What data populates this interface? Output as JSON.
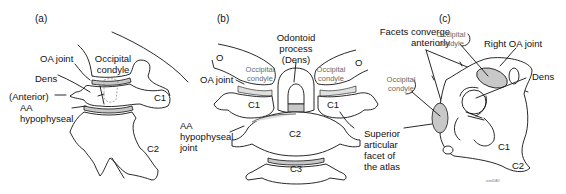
{
  "figure": {
    "panels": [
      {
        "id": "a",
        "tag": "(a)",
        "labels": {
          "oa_joint": "OA joint",
          "occipital_condyle_1": "Occipital",
          "occipital_condyle_2": "condyle",
          "dens": "Dens",
          "anterior": "(Anterior)",
          "aa_1": "AA",
          "aa_2": "hypophyseal",
          "c1": "C1",
          "c2": "C2"
        }
      },
      {
        "id": "b",
        "tag": "(b)",
        "labels": {
          "odontoid_1": "Odontoid",
          "odontoid_2": "process",
          "odontoid_3": "(Dens)",
          "o_left": "O",
          "o_right": "O",
          "oa_joint": "OA joint",
          "occ_left_1": "Occipital",
          "occ_left_2": "condyle",
          "occ_right_1": "Occipital",
          "occ_right_2": "condyle",
          "c1_left": "C1",
          "c1_right": "C1",
          "c2": "C2",
          "c3": "C3",
          "aa_1": "AA",
          "aa_2": "hypophyseal",
          "aa_3": "joint",
          "sup_1": "Superior",
          "sup_2": "articular",
          "sup_3": "facet of",
          "sup_4": "the atlas"
        }
      },
      {
        "id": "c",
        "tag": "(c)",
        "labels": {
          "facets_1": "Facets converge",
          "facets_2": "anteriorly",
          "occ_top_1": "Occipital",
          "occ_top_2": "condyle",
          "occ_left_1": "Occipital",
          "occ_left_2": "condyle",
          "right_oa": "Right OA joint",
          "dens": "Dens",
          "c1": "C1",
          "c2": "C2",
          "credit": "ww0/40"
        }
      }
    ]
  }
}
